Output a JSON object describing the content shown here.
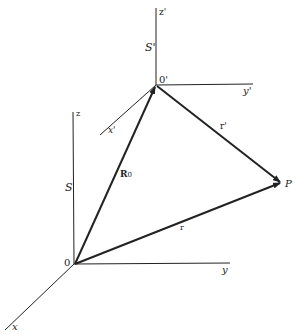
{
  "labels": {
    "z_prime": "z'",
    "s_prime": "S'",
    "o_prime": "0'",
    "y_prime": "y'",
    "x_prime": "x'",
    "r_prime": "r'",
    "z": "z",
    "s": "S",
    "r0": "R",
    "r0_sub": "0",
    "p": "P",
    "r": "r",
    "o": "0",
    "y": "y",
    "x": "x"
  },
  "colors": {
    "line": "#222222",
    "background": "#ffffff"
  }
}
